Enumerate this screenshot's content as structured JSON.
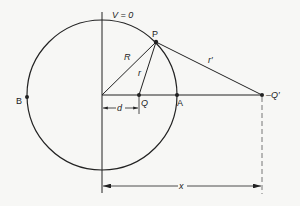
{
  "diagram": {
    "type": "image-charge-sphere",
    "colors": {
      "line": "#222222",
      "dashed": "#777777",
      "background": "#f7f7f5"
    },
    "labels": {
      "potential": "V = 0",
      "point_P": "P",
      "point_A": "A",
      "point_B": "B",
      "charge_Q": "Q",
      "image_charge": "–Q′",
      "radius": "R",
      "distance_r": "r",
      "distance_r_prime": "r′",
      "offset_d": "d",
      "offset_x": "x"
    }
  }
}
